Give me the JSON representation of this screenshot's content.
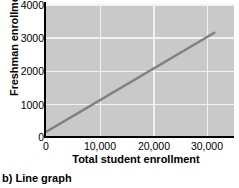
{
  "caption": "b) Line graph",
  "chart_data": {
    "type": "line",
    "title": "",
    "xlabel": "Total student enrollment",
    "ylabel": "Freshman enrollment",
    "xlim": [
      0,
      35000
    ],
    "ylim": [
      0,
      4000
    ],
    "xticks": [
      0,
      10000,
      20000,
      30000
    ],
    "xticklabels": [
      "0",
      "10,000",
      "20,000",
      "30,000"
    ],
    "yticks": [
      0,
      1000,
      2000,
      3000,
      4000
    ],
    "yticklabels": [
      "0",
      "1000",
      "2000",
      "3000",
      "4000"
    ],
    "grid": true,
    "grid_color": "#f2f2f2",
    "plot_bgcolor": "#c9c9c9",
    "legend": null,
    "series": [
      {
        "name": "Freshman enrollment trend",
        "color": "#808080",
        "linewidth": 2.5,
        "x": [
          0,
          31500
        ],
        "y": [
          150,
          3150
        ]
      }
    ]
  }
}
